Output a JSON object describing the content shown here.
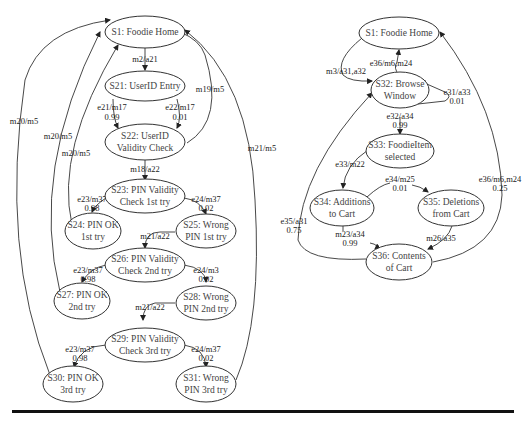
{
  "diagrams": [
    {
      "name": "login-state-machine",
      "nodes": [
        {
          "id": "S1",
          "lines": [
            "S1: Foodie Home"
          ]
        },
        {
          "id": "S21",
          "lines": [
            "S21: UserID Entry"
          ]
        },
        {
          "id": "S22",
          "lines": [
            "S22: UserID",
            "Validity Check"
          ]
        },
        {
          "id": "S23",
          "lines": [
            "S23: PIN Validity",
            "Check 1st try"
          ]
        },
        {
          "id": "S24",
          "lines": [
            "S24: PIN OK",
            "1st try"
          ]
        },
        {
          "id": "S25",
          "lines": [
            "S25: Wrong",
            "PIN 1st try"
          ]
        },
        {
          "id": "S26",
          "lines": [
            "S26: PIN Validity",
            "Check 2nd try"
          ]
        },
        {
          "id": "S27",
          "lines": [
            "S27: PIN OK",
            "2nd try"
          ]
        },
        {
          "id": "S28",
          "lines": [
            "S28: Wrong",
            "PIN 2nd try"
          ]
        },
        {
          "id": "S29",
          "lines": [
            "S29: PIN Validity",
            "Check 3rd try"
          ]
        },
        {
          "id": "S30",
          "lines": [
            "S30: PIN OK",
            "3rd try"
          ]
        },
        {
          "id": "S31",
          "lines": [
            "S31: Wrong",
            "PIN 3rd try"
          ]
        }
      ],
      "edges": [
        {
          "from": "S1",
          "to": "S21",
          "label": "m2/a21",
          "prob": ""
        },
        {
          "from": "S21",
          "to": "S22",
          "label": "e21/m17",
          "prob": "0.99"
        },
        {
          "from": "S21",
          "to": "S22",
          "label": "e22/m17",
          "prob": "0.01"
        },
        {
          "from": "S22",
          "to": "S1",
          "label": "m19/m5",
          "prob": ""
        },
        {
          "from": "S22",
          "to": "S23",
          "label": "m18/a22",
          "prob": ""
        },
        {
          "from": "S23",
          "to": "S24",
          "label": "e23/m37",
          "prob": "0.98"
        },
        {
          "from": "S23",
          "to": "S25",
          "label": "e24/m37",
          "prob": "0.02"
        },
        {
          "from": "S24",
          "to": "S1",
          "label": "m20/m5",
          "prob": ""
        },
        {
          "from": "S25",
          "to": "S26",
          "label": "m21/a22",
          "prob": ""
        },
        {
          "from": "S26",
          "to": "S27",
          "label": "e23/m37",
          "prob": "0.98"
        },
        {
          "from": "S26",
          "to": "S28",
          "label": "e24/m3",
          "prob": "0.02"
        },
        {
          "from": "S27",
          "to": "S1",
          "label": "m20/m5",
          "prob": ""
        },
        {
          "from": "S28",
          "to": "S29",
          "label": "m21/a22",
          "prob": ""
        },
        {
          "from": "S29",
          "to": "S30",
          "label": "e23/m37",
          "prob": "0.98"
        },
        {
          "from": "S29",
          "to": "S31",
          "label": "e24/m37",
          "prob": "0.02"
        },
        {
          "from": "S30",
          "to": "S1",
          "label": "m20/m5",
          "prob": ""
        },
        {
          "from": "S31",
          "to": "S1",
          "label": "m21/m5",
          "prob": ""
        }
      ]
    },
    {
      "name": "cart-state-machine",
      "nodes": [
        {
          "id": "S1",
          "lines": [
            "S1: Foodie Home"
          ]
        },
        {
          "id": "S32",
          "lines": [
            "S32: Browse",
            "Window"
          ]
        },
        {
          "id": "S33",
          "lines": [
            "S33: FoodieItem",
            "selected"
          ]
        },
        {
          "id": "S34",
          "lines": [
            "S34: Additions",
            "to Cart"
          ]
        },
        {
          "id": "S35",
          "lines": [
            "S35: Deletions",
            "from Cart"
          ]
        },
        {
          "id": "S36",
          "lines": [
            "S36: Contents",
            "of Cart"
          ]
        }
      ],
      "edges": [
        {
          "from": "S1",
          "to": "S32",
          "label": "m3/a31,a32",
          "prob": ""
        },
        {
          "from": "S32",
          "to": "S1",
          "label": "e36/m6,m24",
          "prob": ""
        },
        {
          "from": "S32",
          "to": "S32",
          "label": "e31/a33",
          "prob": "0.01"
        },
        {
          "from": "S32",
          "to": "S33",
          "label": "e32/a34",
          "prob": "0.99"
        },
        {
          "from": "S33",
          "to": "S34",
          "label": "e33/m22",
          "prob": ""
        },
        {
          "from": "S34",
          "to": "S35",
          "label": "e34/m25",
          "prob": "0.01"
        },
        {
          "from": "S34",
          "to": "S36",
          "label": "m23/a34",
          "prob": "0.99"
        },
        {
          "from": "S35",
          "to": "S36",
          "label": "m26/a35",
          "prob": ""
        },
        {
          "from": "S36",
          "to": "S32",
          "label": "e35/a31",
          "prob": "0.75"
        },
        {
          "from": "S36",
          "to": "S1",
          "label": "e36/m6,m24",
          "prob": "0.25"
        }
      ]
    }
  ]
}
